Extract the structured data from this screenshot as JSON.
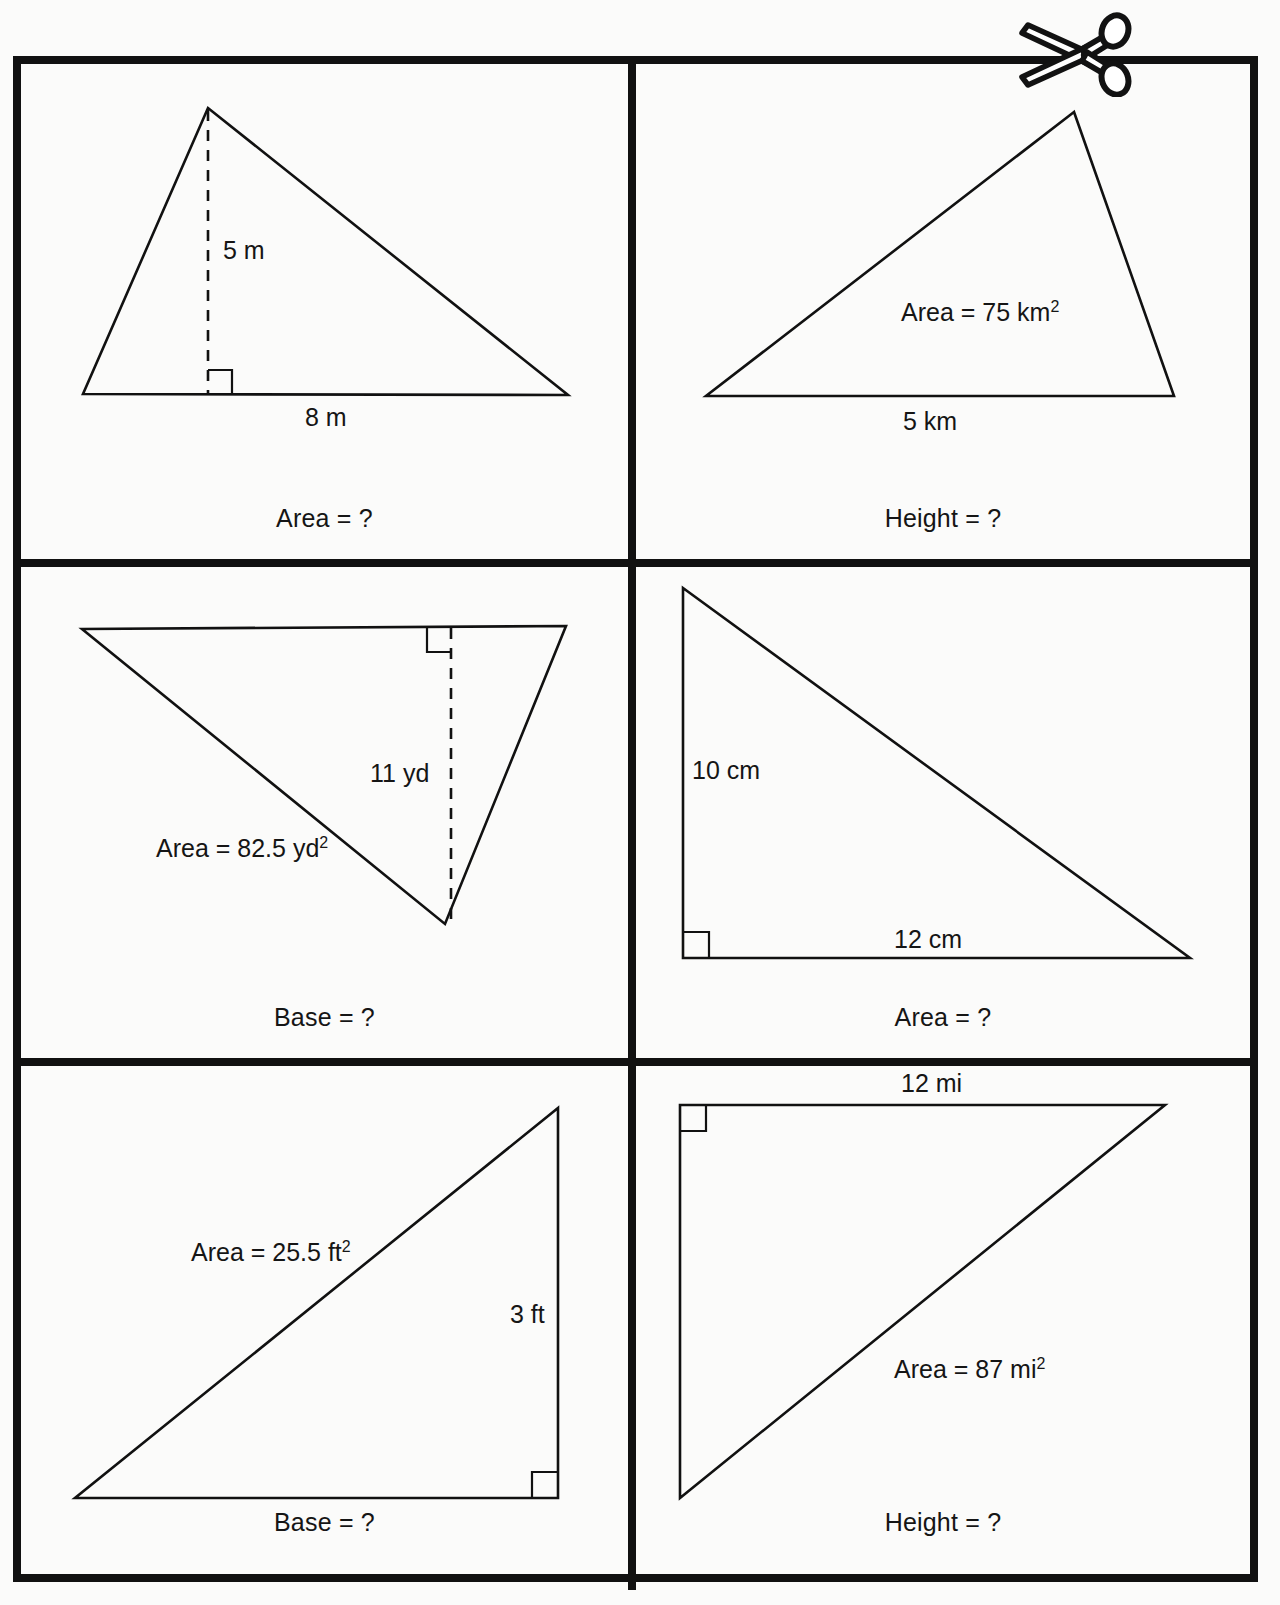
{
  "worksheet": {
    "background_color": "#fbfbfa",
    "ink_color": "#111111",
    "scissors_icon": "scissors-icon"
  },
  "cards": [
    {
      "id": "card-1",
      "position": "top-left",
      "caption": "Area = ?",
      "labels": {
        "height": "5 m",
        "base": "8 m"
      },
      "shape": "obtuse-triangle",
      "has_dashed_height": true,
      "has_right_angle_mark": true
    },
    {
      "id": "card-2",
      "position": "top-right",
      "caption": "Height = ?",
      "labels": {
        "area": "Area = 75 km",
        "area_exponent": "2",
        "base": "5 km"
      },
      "shape": "scalene-triangle",
      "has_dashed_height": false,
      "has_right_angle_mark": false
    },
    {
      "id": "card-3",
      "position": "middle-left",
      "caption": "Base = ?",
      "labels": {
        "area": "Area = 82.5 yd",
        "area_exponent": "2",
        "height": "11 yd"
      },
      "shape": "inverted-triangle",
      "has_dashed_height": true,
      "has_right_angle_mark": true
    },
    {
      "id": "card-4",
      "position": "middle-right",
      "caption": "Area = ?",
      "labels": {
        "height": "10 cm",
        "base": "12 cm"
      },
      "shape": "right-triangle",
      "has_dashed_height": false,
      "has_right_angle_mark": true
    },
    {
      "id": "card-5",
      "position": "bottom-left",
      "caption": "Base = ?",
      "labels": {
        "area": "Area = 25.5 ft",
        "area_exponent": "2",
        "height": "3 ft"
      },
      "shape": "right-triangle",
      "has_dashed_height": false,
      "has_right_angle_mark": true
    },
    {
      "id": "card-6",
      "position": "bottom-right",
      "caption": "Height = ?",
      "labels": {
        "base": "12 mi",
        "area": "Area = 87 mi",
        "area_exponent": "2"
      },
      "shape": "right-triangle",
      "has_dashed_height": false,
      "has_right_angle_mark": true
    }
  ]
}
